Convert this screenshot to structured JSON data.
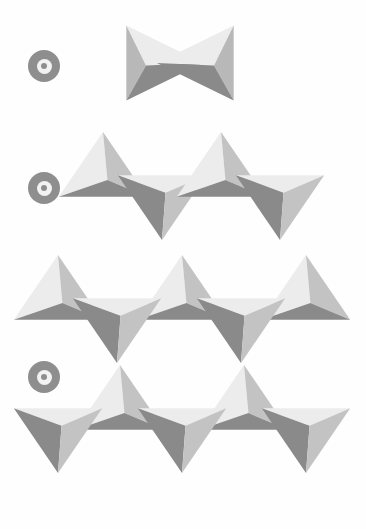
{
  "figure": {
    "background_color": "#fefefe",
    "marker_icon": "bullseye-marker-icon",
    "marker_color": "#8e8e8e",
    "marker_inner_ring_color": "#f2f2f2",
    "marker_center_dot_color": "#8e8e8e",
    "face_colors": {
      "light": "#ececec",
      "light_alt": "#e4e4e4",
      "medium": "#c3c3c3",
      "medium_alt": "#b8b8b8",
      "dark": "#8a8a8a",
      "dark_alt": "#9a9a9a"
    },
    "rows": [
      {
        "id": "row-dimer",
        "marker": {
          "x": 28,
          "y": 50,
          "size": 32
        },
        "motif": "corner-sharing tetrahedral dimer (bowtie)",
        "unit_count": 2
      },
      {
        "id": "row-chain",
        "marker": {
          "x": 28,
          "y": 172,
          "size": 32
        },
        "motif": "corner-sharing tetrahedral chain",
        "unit_count": 4
      },
      {
        "id": "row-sheet",
        "marker": {
          "x": 28,
          "y": 361,
          "size": 32
        },
        "motif": "corner-sharing tetrahedral sheet (hexagonal net)",
        "unit_count": 12
      }
    ],
    "tetrahedra": [
      {
        "row": "row-dimer",
        "dir": "left",
        "cx": 160,
        "cy": 63,
        "s": 36
      },
      {
        "row": "row-dimer",
        "dir": "right",
        "cx": 200,
        "cy": 63,
        "s": 36
      },
      {
        "row": "row-chain",
        "dir": "up",
        "cx": 103,
        "cy": 172,
        "s": 34
      },
      {
        "row": "row-chain",
        "dir": "down",
        "cx": 162,
        "cy": 200,
        "s": 34
      },
      {
        "row": "row-chain",
        "dir": "up",
        "cx": 221,
        "cy": 172,
        "s": 34
      },
      {
        "row": "row-chain",
        "dir": "down",
        "cx": 280,
        "cy": 200,
        "s": 34
      },
      {
        "row": "row-sheet",
        "dir": "up",
        "cx": 58,
        "cy": 295,
        "s": 34
      },
      {
        "row": "row-sheet",
        "dir": "up",
        "cx": 182,
        "cy": 295,
        "s": 34
      },
      {
        "row": "row-sheet",
        "dir": "up",
        "cx": 306,
        "cy": 295,
        "s": 34
      },
      {
        "row": "row-sheet",
        "dir": "down",
        "cx": 117,
        "cy": 323,
        "s": 34
      },
      {
        "row": "row-sheet",
        "dir": "down",
        "cx": 241,
        "cy": 323,
        "s": 34
      },
      {
        "row": "row-sheet",
        "dir": "up",
        "cx": 120,
        "cy": 405,
        "s": 34
      },
      {
        "row": "row-sheet",
        "dir": "up",
        "cx": 244,
        "cy": 405,
        "s": 34
      },
      {
        "row": "row-sheet",
        "dir": "down",
        "cx": 58,
        "cy": 433,
        "s": 34
      },
      {
        "row": "row-sheet",
        "dir": "down",
        "cx": 182,
        "cy": 433,
        "s": 34
      },
      {
        "row": "row-sheet",
        "dir": "down",
        "cx": 306,
        "cy": 433,
        "s": 34
      }
    ]
  }
}
